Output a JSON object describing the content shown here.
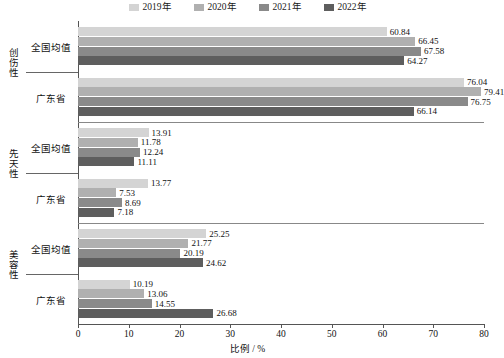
{
  "chart_data": {
    "type": "bar",
    "orientation": "horizontal",
    "title": "",
    "xlabel": "比例 / %",
    "ylabel": "",
    "xlim": [
      0,
      80
    ],
    "xticks": [
      0,
      10,
      20,
      30,
      40,
      50,
      60,
      70,
      80
    ],
    "grid": false,
    "legend_position": "top-center",
    "series": [
      {
        "name": "2019年",
        "color": "#d4d4d4"
      },
      {
        "name": "2020年",
        "color": "#b0b0b0"
      },
      {
        "name": "2021年",
        "color": "#8a8a8a"
      },
      {
        "name": "2022年",
        "color": "#5e5e5e"
      }
    ],
    "groups": [
      {
        "category": "创伤性",
        "subgroups": [
          {
            "label": "全国均值",
            "values": [
              60.84,
              66.45,
              67.58,
              64.27
            ]
          },
          {
            "label": "广东省",
            "values": [
              76.04,
              79.41,
              76.75,
              66.14
            ]
          }
        ]
      },
      {
        "category": "先天性",
        "subgroups": [
          {
            "label": "全国均值",
            "values": [
              13.91,
              11.78,
              12.24,
              11.11
            ]
          },
          {
            "label": "广东省",
            "values": [
              13.77,
              7.53,
              8.69,
              7.18
            ]
          }
        ]
      },
      {
        "category": "美容性",
        "subgroups": [
          {
            "label": "全国均值",
            "values": [
              25.25,
              21.77,
              20.19,
              24.62
            ]
          },
          {
            "label": "广东省",
            "values": [
              10.19,
              13.06,
              14.55,
              26.68
            ]
          }
        ]
      }
    ]
  }
}
